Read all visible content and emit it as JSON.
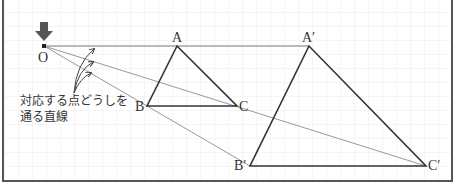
{
  "diagram": {
    "center": {
      "label": "O",
      "x": 44,
      "y": 46
    },
    "small_triangle": {
      "A": {
        "label": "A",
        "x": 177,
        "y": 46
      },
      "B": {
        "label": "B",
        "x": 147,
        "y": 106
      },
      "C": {
        "label": "C",
        "x": 237,
        "y": 106
      }
    },
    "large_triangle": {
      "A": {
        "label": "A′",
        "x": 309,
        "y": 46
      },
      "B": {
        "label": "B′",
        "x": 250,
        "y": 166
      },
      "C": {
        "label": "C′",
        "x": 426,
        "y": 166
      }
    },
    "annotation": {
      "line1": "対応する点どうしを",
      "line2": "通る直線"
    },
    "colors": {
      "triangle": "#333333",
      "ray": "#999999",
      "grid": "#ececec",
      "arrow": "#444444"
    }
  }
}
